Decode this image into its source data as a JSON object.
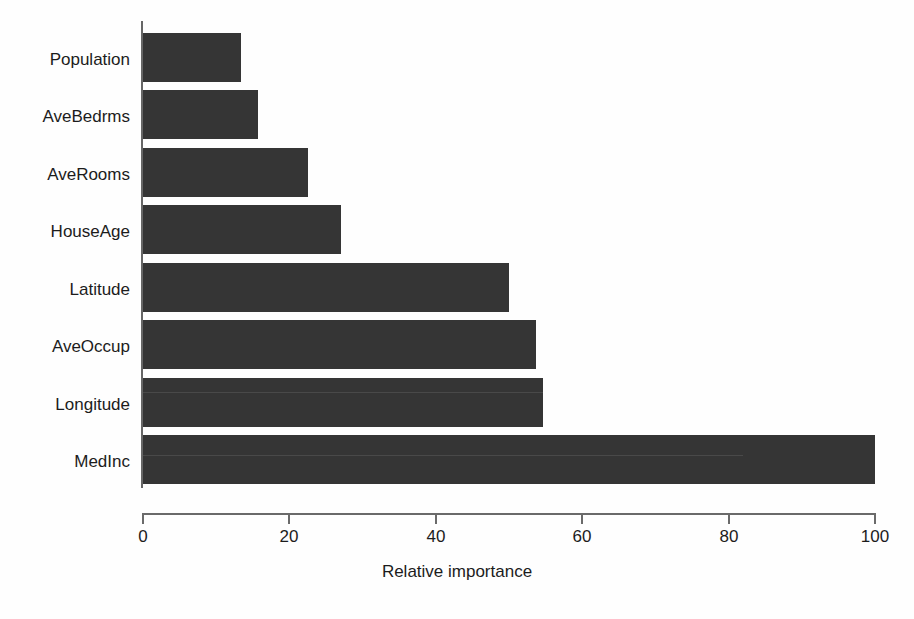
{
  "chart_data": {
    "type": "bar",
    "orientation": "horizontal",
    "title": "",
    "xlabel": "Relative importance",
    "ylabel": "",
    "categories": [
      "MedInc",
      "Longitude",
      "AveOccup",
      "Latitude",
      "HouseAge",
      "AveRooms",
      "AveBedrms",
      "Population"
    ],
    "values": [
      100,
      54.6,
      53.7,
      50.0,
      27.0,
      22.5,
      15.7,
      13.4
    ],
    "display_order_top_to_bottom": [
      "Population",
      "AveBedrms",
      "AveRooms",
      "HouseAge",
      "Latitude",
      "AveOccup",
      "Longitude",
      "MedInc"
    ],
    "bars": [
      {
        "label": "Population",
        "value": 13.4
      },
      {
        "label": "AveBedrms",
        "value": 15.7
      },
      {
        "label": "AveRooms",
        "value": 22.5
      },
      {
        "label": "HouseAge",
        "value": 27.0
      },
      {
        "label": "Latitude",
        "value": 50.0
      },
      {
        "label": "AveOccup",
        "value": 53.7
      },
      {
        "label": "Longitude",
        "value": 54.6
      },
      {
        "label": "MedInc",
        "value": 100
      }
    ],
    "xlim": [
      0,
      100
    ],
    "xticks": [
      0,
      20,
      40,
      60,
      80,
      100
    ],
    "xtick_labels": [
      "0",
      "20",
      "40",
      "60",
      "80",
      "100"
    ],
    "grid": false,
    "legend": null,
    "colors": {
      "bar": "#353535",
      "axis": "#6a6a6a",
      "text": "#1c1c1c",
      "background": "#fefefe"
    }
  }
}
